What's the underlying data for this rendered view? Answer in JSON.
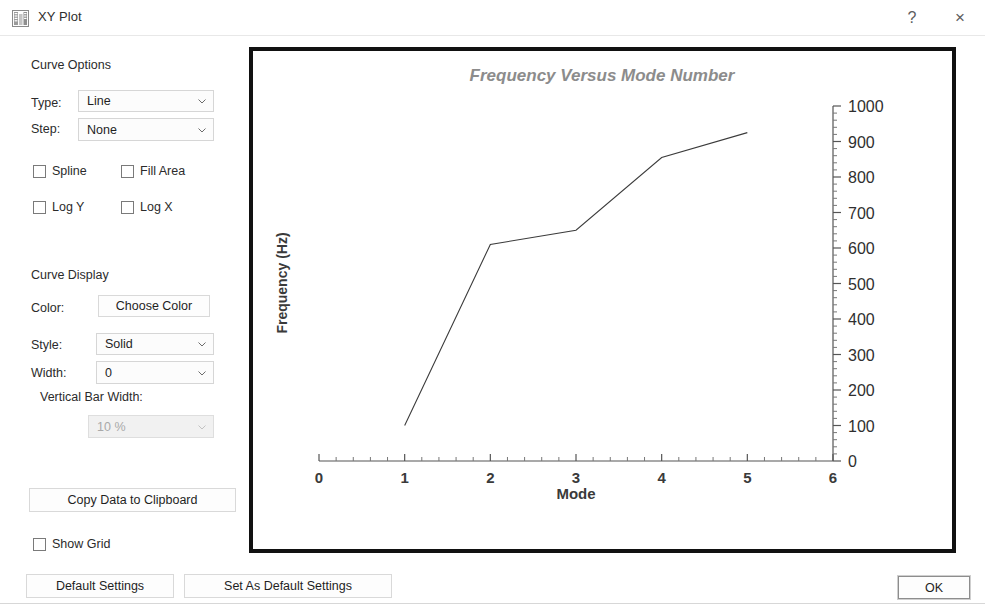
{
  "window": {
    "title": "XY Plot",
    "icon": "chart-grid-icon",
    "help_label": "?",
    "close_label": "×"
  },
  "curve_options": {
    "group_label": "Curve Options",
    "type_label": "Type:",
    "type_value": "Line",
    "step_label": "Step:",
    "step_value": "None",
    "checkboxes": [
      {
        "label": "Spline",
        "checked": false
      },
      {
        "label": "Fill Area",
        "checked": false
      },
      {
        "label": "Log Y",
        "checked": false
      },
      {
        "label": "Log X",
        "checked": false
      }
    ]
  },
  "curve_display": {
    "group_label": "Curve Display",
    "color_label": "Color:",
    "choose_color_label": "Choose Color",
    "style_label": "Style:",
    "style_value": "Solid",
    "width_label": "Width:",
    "width_value": "0",
    "vertical_bar_width_label": "Vertical Bar Width:",
    "vertical_bar_width_value": "10 %"
  },
  "actions": {
    "copy_data_label": "Copy Data to Clipboard",
    "show_grid_label": "Show Grid",
    "show_grid_checked": false,
    "default_settings_label": "Default Settings",
    "set_as_default_settings_label": "Set As Default Settings",
    "ok_label": "OK"
  },
  "colors": {
    "plot_border": "#111111",
    "title_text": "#8c8c8c",
    "axis": "#555555",
    "curve": "#3b3b3b",
    "dialog_text": "#2b2b2b"
  },
  "chart_data": {
    "type": "line",
    "title": "Frequency Versus Mode Number",
    "xlabel": "Mode",
    "ylabel": "Frequency (Hz)",
    "x": [
      1,
      2,
      3,
      4,
      5
    ],
    "values": [
      100,
      610,
      650,
      855,
      925
    ],
    "series": [
      {
        "name": "Frequency",
        "values": [
          100,
          610,
          650,
          855,
          925
        ]
      }
    ],
    "xlim": [
      0,
      6
    ],
    "ylim": [
      0,
      1000
    ],
    "xticks": [
      0,
      1,
      2,
      3,
      4,
      5,
      6
    ],
    "yticks": [
      0,
      100,
      200,
      300,
      400,
      500,
      600,
      700,
      800,
      900,
      1000
    ],
    "xtick_labels": [
      "0",
      "1",
      "2",
      "3",
      "4",
      "5",
      "6"
    ],
    "ytick_labels": [
      "0",
      "100",
      "200",
      "300",
      "400",
      "500",
      "600",
      "700",
      "800",
      "900",
      "1000"
    ],
    "y_axis_position": "right",
    "grid": false,
    "legend": false,
    "minor_ticks": true
  }
}
